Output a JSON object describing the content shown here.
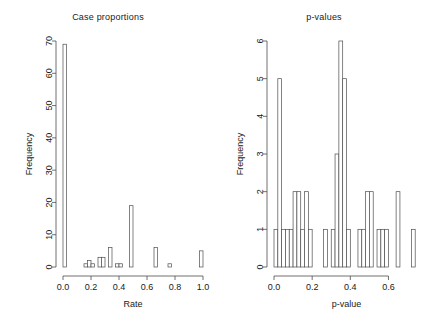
{
  "figure": {
    "background": "#ffffff",
    "ink": "#4d4d4d",
    "text_color": "#1a1a1a"
  },
  "panels": [
    {
      "title": "Case proportions",
      "xlabel": "Rate",
      "ylabel": "Frequency"
    },
    {
      "title": "p-values",
      "xlabel": "p-value",
      "ylabel": "Frequency"
    }
  ],
  "chart_data": [
    {
      "type": "bar",
      "title": "Case proportions",
      "xlabel": "Rate",
      "ylabel": "Frequency",
      "xlim": [
        0.0,
        1.0
      ],
      "ylim": [
        0,
        70
      ],
      "xticks": [
        0.0,
        0.2,
        0.4,
        0.6,
        0.8,
        1.0
      ],
      "xticklabels": [
        "0.0",
        "0.2",
        "0.4",
        "0.6",
        "0.8",
        "1.0"
      ],
      "yticks": [
        0,
        10,
        20,
        30,
        40,
        50,
        60,
        70
      ],
      "yticklabels": [
        "0",
        "10",
        "20",
        "30",
        "40",
        "50",
        "60",
        "70"
      ],
      "grid": false,
      "legend": false,
      "bin_width": 0.025,
      "bin_lefts": [
        0.0,
        0.15,
        0.175,
        0.2,
        0.25,
        0.275,
        0.325,
        0.375,
        0.4,
        0.475,
        0.65,
        0.75,
        0.975
      ],
      "values": [
        69,
        1,
        2,
        1,
        3,
        3,
        6,
        1,
        1,
        19,
        6,
        1,
        5
      ]
    },
    {
      "type": "bar",
      "title": "p-values",
      "xlabel": "p-value",
      "ylabel": "Frequency",
      "xlim": [
        0.0,
        0.76
      ],
      "ylim": [
        0,
        6
      ],
      "xticks": [
        0.0,
        0.2,
        0.4,
        0.6
      ],
      "xticklabels": [
        "0.0",
        "0.2",
        "0.4",
        "0.6"
      ],
      "yticks": [
        0,
        1,
        2,
        3,
        4,
        5,
        6
      ],
      "yticklabels": [
        "0",
        "1",
        "2",
        "3",
        "4",
        "5",
        "6"
      ],
      "grid": false,
      "legend": false,
      "bin_width": 0.02,
      "bin_lefts": [
        0.0,
        0.02,
        0.04,
        0.06,
        0.08,
        0.1,
        0.12,
        0.14,
        0.16,
        0.18,
        0.26,
        0.3,
        0.32,
        0.34,
        0.36,
        0.38,
        0.44,
        0.46,
        0.48,
        0.5,
        0.54,
        0.56,
        0.58,
        0.64,
        0.72
      ],
      "values": [
        1,
        5,
        1,
        1,
        1,
        2,
        2,
        1,
        2,
        1,
        1,
        1,
        3,
        6,
        5,
        1,
        1,
        1,
        2,
        2,
        1,
        1,
        1,
        2,
        1
      ]
    }
  ]
}
